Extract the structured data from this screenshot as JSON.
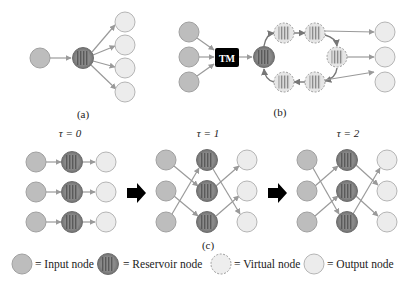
{
  "panels": {
    "a": {
      "caption": "(a)"
    },
    "b": {
      "caption": "(b)",
      "tm_label": "TM"
    },
    "c": {
      "caption": "(c)"
    }
  },
  "time_steps": [
    {
      "label": "τ = 0"
    },
    {
      "label": "τ = 1"
    },
    {
      "label": "τ = 2"
    }
  ],
  "legend": [
    {
      "type": "input",
      "label": "= Input node"
    },
    {
      "type": "reservoir",
      "label": "= Reservoir node"
    },
    {
      "type": "virtual",
      "label": "= Virtual node"
    },
    {
      "type": "output",
      "label": "= Output node"
    }
  ],
  "colors": {
    "input_fill": "#bdbdbd",
    "input_stroke": "#a0a0a0",
    "reservoir_fill": "#8a8a8a",
    "reservoir_stroke": "#6e6e6e",
    "virtual_fill": "#dcdcdc",
    "output_fill": "#ececec",
    "output_stroke": "#b5b5b5",
    "edge": "#9a9a9a",
    "tm_box": "#000000",
    "step_arrow": "#000000"
  },
  "connections": {
    "tau0": {
      "input_to_reservoir": [
        1,
        2,
        3
      ],
      "reservoir_to_output": [
        1,
        2,
        3
      ]
    },
    "tau1": {
      "input_to_reservoir": [
        2,
        3,
        1
      ],
      "reservoir_to_output": [
        3,
        1,
        2
      ]
    },
    "tau2": {
      "input_to_reservoir": [
        3,
        1,
        2
      ],
      "reservoir_to_output": [
        2,
        3,
        1
      ]
    }
  }
}
